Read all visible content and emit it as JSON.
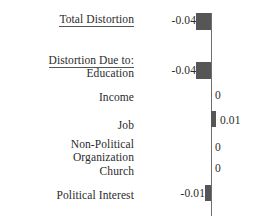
{
  "chart_data": {
    "type": "bar",
    "title": "",
    "orientation": "horizontal",
    "xlabel": "",
    "ylabel": "",
    "zero_axis": true,
    "grid": false,
    "legend": null,
    "section_headers": [
      {
        "label": "Total Distortion",
        "underlined": true
      },
      {
        "label": "Distortion Due to:",
        "underlined": true
      }
    ],
    "categories": [
      "Total Distortion",
      "Education",
      "Income",
      "Job",
      "Non-Political Organization",
      "Church",
      "Political Interest"
    ],
    "values": [
      -0.04,
      -0.04,
      0,
      0.01,
      0,
      0,
      -0.01
    ],
    "value_labels": [
      "-0.04",
      "-0.04",
      "0",
      "0.01",
      "0",
      "0",
      "-0.01"
    ],
    "bar_color": "#565656",
    "axis_color": "#6f6f6f",
    "rows": [
      {
        "name": "total-distortion",
        "label": "Total Distortion",
        "label_line2": "",
        "underlined": true,
        "is_header": true,
        "value": -0.04,
        "value_label": "-0.04",
        "label_y": 13,
        "value_y": 14,
        "bar": {
          "x": 196,
          "y": 13,
          "w": 15,
          "h": 17
        },
        "value_x_right": 196
      },
      {
        "name": "distortion-due-to",
        "label": "Distortion Due to:",
        "label_line2": "",
        "underlined": true,
        "is_header": true,
        "value": null,
        "value_label": "",
        "label_y": 54,
        "value_y": 0,
        "bar": null,
        "value_x_right": 0
      },
      {
        "name": "education",
        "label": "Education",
        "label_line2": "",
        "underlined": false,
        "is_header": false,
        "value": -0.04,
        "value_label": "-0.04",
        "label_y": 67,
        "value_y": 64,
        "bar": {
          "x": 196,
          "y": 62,
          "w": 15,
          "h": 17
        },
        "value_x_right": 196
      },
      {
        "name": "income",
        "label": "Income",
        "label_line2": "",
        "underlined": false,
        "is_header": false,
        "value": 0,
        "value_label": "0",
        "label_y": 91,
        "value_y": 89,
        "bar": null,
        "value_x_left": 215
      },
      {
        "name": "job",
        "label": "Job",
        "label_line2": "",
        "underlined": false,
        "is_header": false,
        "value": 0.01,
        "value_label": "0.01",
        "label_y": 119,
        "value_y": 114,
        "bar": {
          "x": 211,
          "y": 111,
          "w": 5,
          "h": 16
        },
        "value_x_left": 220
      },
      {
        "name": "non-political-organization",
        "label": "Non-Political",
        "label_line2": "Organization",
        "underlined": false,
        "is_header": false,
        "value": 0,
        "value_label": "0",
        "label_y": 138,
        "value_y": 141,
        "bar": null,
        "value_x_left": 215
      },
      {
        "name": "church",
        "label": "Church",
        "label_line2": "",
        "underlined": false,
        "is_header": false,
        "value": 0,
        "value_label": "0",
        "label_y": 165,
        "value_y": 162,
        "bar": null,
        "value_x_left": 215
      },
      {
        "name": "political-interest",
        "label": "Political Interest",
        "label_line2": "",
        "underlined": false,
        "is_header": false,
        "value": -0.01,
        "value_label": "-0.01",
        "label_y": 189,
        "value_y": 187,
        "bar": {
          "x": 205,
          "y": 185,
          "w": 6,
          "h": 16
        },
        "value_x_right": 205
      }
    ],
    "axis": {
      "x": 211,
      "y_top": 13,
      "y_bottom": 216
    }
  }
}
